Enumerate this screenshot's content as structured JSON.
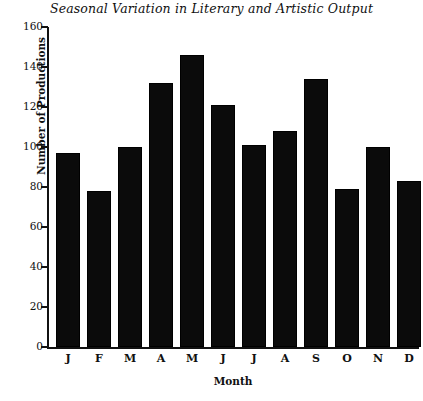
{
  "chart_data": {
    "type": "bar",
    "title": "Seasonal Variation in Literary and Artistic Output",
    "xlabel": "Month",
    "ylabel": "Number of Productions",
    "categories": [
      "J",
      "F",
      "M",
      "A",
      "M",
      "J",
      "J",
      "A",
      "S",
      "O",
      "N",
      "D"
    ],
    "values": [
      97,
      78,
      100,
      132,
      146,
      121,
      101,
      108,
      134,
      79,
      100,
      83
    ],
    "ylim": [
      0,
      160
    ],
    "ytick_labels": [
      "0",
      "20",
      "40",
      "60",
      "80",
      "100",
      "120",
      "140",
      "160"
    ],
    "ytick_values": [
      0,
      20,
      40,
      60,
      80,
      100,
      120,
      140,
      160
    ],
    "grid": false,
    "legend": false,
    "bar_color": "#0b0b0b",
    "background_color": "#ffffff",
    "axis_color": "#111111",
    "spines": [
      "left",
      "bottom"
    ]
  }
}
